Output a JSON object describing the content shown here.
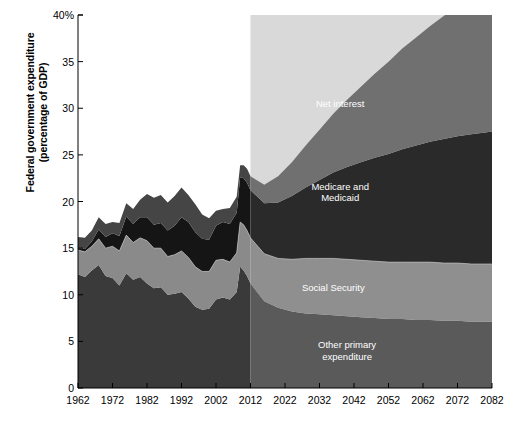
{
  "chart_data": {
    "type": "area",
    "stacked": true,
    "title": "",
    "subtitle": "",
    "xlabel": "",
    "ylabel": "Federal government expenditure\n(percentage of GDP)",
    "ylabel_line1": "Federal government expenditure",
    "ylabel_line2": "(percentage of GDP)",
    "xlim": [
      1962,
      2082
    ],
    "ylim": [
      0,
      40
    ],
    "grid": false,
    "legend_position": "inline-annotations",
    "y_ticks": [
      0,
      5,
      10,
      15,
      20,
      25,
      30,
      35,
      40
    ],
    "y_tick_labels": [
      "0",
      "5",
      "10",
      "15",
      "20",
      "25",
      "30",
      "35",
      "40%"
    ],
    "x_ticks": [
      1962,
      1972,
      1982,
      1992,
      2002,
      2012,
      2022,
      2032,
      2042,
      2052,
      2062,
      2072,
      2082
    ],
    "x_tick_labels": [
      "1962",
      "1972",
      "1982",
      "1992",
      "2002",
      "2012",
      "2022",
      "2032",
      "2042",
      "2052",
      "2062",
      "2072",
      "2082"
    ],
    "projection_start_year": 2012,
    "historical_background": "#ffffff",
    "projection_background": "#d9d9d9",
    "annotations": [
      {
        "text": "Net interest",
        "series": "Net interest",
        "x_year": 2038,
        "y_value": 30.5
      },
      {
        "text": "Medicare and\nMedicaid",
        "series": "Medicare and Medicaid",
        "x_year": 2038,
        "y_value": 21.0
      },
      {
        "text": "Social Security",
        "series": "Social Security",
        "x_year": 2036,
        "y_value": 10.8
      },
      {
        "text": "Other primary\nexpenditure",
        "series": "Other primary expenditure",
        "x_year": 2040,
        "y_value": 4.0
      }
    ],
    "x": [
      1962,
      1964,
      1966,
      1968,
      1970,
      1972,
      1974,
      1976,
      1978,
      1980,
      1982,
      1984,
      1986,
      1988,
      1990,
      1992,
      1994,
      1996,
      1998,
      2000,
      2002,
      2004,
      2006,
      2008,
      2009,
      2010,
      2011,
      2012,
      2016,
      2020,
      2024,
      2028,
      2032,
      2036,
      2040,
      2044,
      2048,
      2052,
      2056,
      2060,
      2064,
      2068,
      2072,
      2076,
      2080,
      2082
    ],
    "series": [
      {
        "name": "Other primary expenditure",
        "label": "Other primary expenditure",
        "color_historical": "#3a3a3a",
        "color_projection": "#5a5a5a",
        "values": [
          12.2,
          11.9,
          12.6,
          13.2,
          12.0,
          11.8,
          11.0,
          12.3,
          11.6,
          11.9,
          11.2,
          10.7,
          10.8,
          10.0,
          10.1,
          10.3,
          9.6,
          8.7,
          8.4,
          8.5,
          9.5,
          9.7,
          9.5,
          10.3,
          13.0,
          12.6,
          12.0,
          11.2,
          9.3,
          8.6,
          8.2,
          8.0,
          7.9,
          7.8,
          7.7,
          7.6,
          7.5,
          7.4,
          7.4,
          7.3,
          7.3,
          7.2,
          7.2,
          7.1,
          7.1,
          7.1
        ]
      },
      {
        "name": "Social Security",
        "label": "Social Security",
        "color_historical": "#8a8a8a",
        "color_projection": "#8f8f8f",
        "values": [
          2.6,
          2.7,
          2.6,
          2.8,
          3.0,
          3.4,
          3.7,
          4.1,
          4.0,
          4.2,
          4.6,
          4.3,
          4.2,
          4.1,
          4.2,
          4.4,
          4.4,
          4.3,
          4.1,
          4.0,
          4.2,
          4.1,
          4.0,
          4.2,
          4.8,
          4.9,
          4.9,
          4.9,
          5.1,
          5.3,
          5.6,
          5.9,
          6.0,
          6.1,
          6.1,
          6.1,
          6.1,
          6.1,
          6.1,
          6.2,
          6.2,
          6.2,
          6.2,
          6.2,
          6.2,
          6.2
        ]
      },
      {
        "name": "Medicare and Medicaid",
        "label": "Medicare and Medicaid",
        "color_historical": "#151515",
        "color_projection": "#2a2a2a",
        "values": [
          0.2,
          0.3,
          0.5,
          1.0,
          1.2,
          1.4,
          1.6,
          2.0,
          2.0,
          2.2,
          2.5,
          2.5,
          2.7,
          2.8,
          3.1,
          3.6,
          3.8,
          3.7,
          3.5,
          3.4,
          3.7,
          4.0,
          4.1,
          4.3,
          4.8,
          5.0,
          5.1,
          5.1,
          5.4,
          6.0,
          6.8,
          7.6,
          8.4,
          9.2,
          9.9,
          10.5,
          11.1,
          11.6,
          12.1,
          12.5,
          12.9,
          13.3,
          13.6,
          13.9,
          14.1,
          14.2
        ]
      },
      {
        "name": "Net interest",
        "label": "Net interest",
        "color_historical": "#454545",
        "color_projection": "#707070",
        "values": [
          1.2,
          1.2,
          1.2,
          1.3,
          1.4,
          1.2,
          1.4,
          1.4,
          1.6,
          1.9,
          2.5,
          2.9,
          3.0,
          3.0,
          3.2,
          3.2,
          2.9,
          3.0,
          2.6,
          2.3,
          1.6,
          1.4,
          1.7,
          1.7,
          1.3,
          1.4,
          1.5,
          1.5,
          2.0,
          2.8,
          3.6,
          4.5,
          5.4,
          6.3,
          7.2,
          8.1,
          9.0,
          9.9,
          10.8,
          11.6,
          12.4,
          13.2,
          13.9,
          14.6,
          15.2,
          15.5
        ]
      }
    ]
  }
}
